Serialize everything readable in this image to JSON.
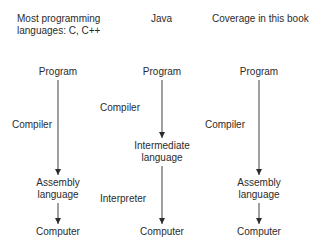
{
  "columns": [
    {
      "header_line1": "Most programming",
      "header_line2": "languages: C, C++",
      "nodes": [
        "Program",
        "Assembly",
        "language",
        "Computer"
      ],
      "edge_labels": [
        "Compiler"
      ]
    },
    {
      "header_line1": "Java",
      "nodes": [
        "Program",
        "Intermediate",
        "language",
        "Computer"
      ],
      "edge_labels": [
        "Compiler",
        "Interpreter"
      ]
    },
    {
      "header_line1": "Coverage in this book",
      "nodes": [
        "Program",
        "Assembly",
        "language",
        "Computer"
      ],
      "edge_labels": [
        "Compiler"
      ]
    }
  ],
  "colors": {
    "text": "#2b2b2b",
    "line": "#2b2b2b",
    "background": "#ffffff"
  }
}
